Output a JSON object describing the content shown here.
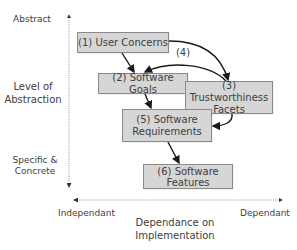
{
  "diagram": {
    "y_axis": {
      "title_line1": "Level of",
      "title_line2": "Abstraction",
      "top_label": "Abstract",
      "bottom_label_line1": "Specific &",
      "bottom_label_line2": "Concrete"
    },
    "x_axis": {
      "title_line1": "Dependance on",
      "title_line2": "Implementation",
      "left_label": "Independant",
      "right_label": "Dependant"
    },
    "boxes": [
      {
        "id": "1",
        "line1": "(1) User Concerns",
        "line2": ""
      },
      {
        "id": "2",
        "line1": "(2) Software Goals",
        "line2": ""
      },
      {
        "id": "3",
        "line1": "(3) Trustworthiness",
        "line2": "Facets"
      },
      {
        "id": "5",
        "line1": "(5) Software",
        "line2": "Requirements"
      },
      {
        "id": "6",
        "line1": "(6) Software",
        "line2": "Features"
      }
    ],
    "edge_labels": {
      "feedback": "(4)"
    },
    "colors": {
      "box_fill": "#d6d6d6",
      "box_border": "#8a8a8a",
      "arrow": "#1a1a1a",
      "axis": "#555555"
    }
  }
}
